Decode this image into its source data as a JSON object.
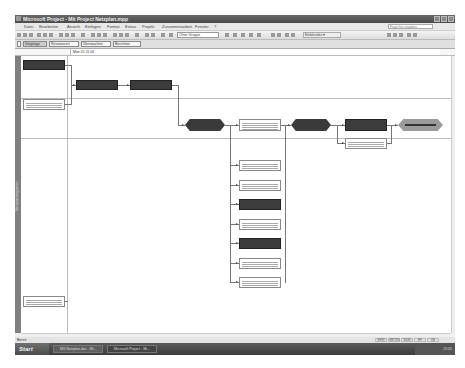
{
  "window": {
    "title": "Microsoft Project - Mit Project Netzplan.mpp"
  },
  "menu": {
    "items": [
      "Datei",
      "Bearbeiten",
      "Ansicht",
      "Einfügen",
      "Format",
      "Extras",
      "Projekt",
      "Zusammenarbeit",
      "Fenster",
      "?"
    ],
    "help_placeholder": "Frage hier eingeben"
  },
  "toolbar": {
    "group_combo": "Ohne Gruppe",
    "zoom_combo": "Einblenden ▾"
  },
  "guide": {
    "buttons": [
      "Vorgänge",
      "Ressourcen",
      "Überwachen",
      "Berichten"
    ]
  },
  "entry": {
    "value": "Mon 01.11.06"
  },
  "view": {
    "label": "Netzplandiagramm"
  },
  "status": {
    "text": "Bereit",
    "indicators": [
      "ERW",
      "GROSS",
      "NUM",
      "RF",
      "ÜB"
    ]
  },
  "taskbar": {
    "start_label": "Start",
    "tasks": [
      "MS Netzplan.doc - Mi...",
      "Microsoft Project - Mi..."
    ],
    "clock": "20:45"
  },
  "diagram": {
    "nodes": [
      {
        "id": "n1",
        "type": "crit",
        "x": 2,
        "y": 4,
        "w": 42,
        "h": 10
      },
      {
        "id": "n2",
        "type": "norm",
        "x": 2,
        "y": 43,
        "w": 42,
        "h": 11
      },
      {
        "id": "n3",
        "type": "crit",
        "x": 55,
        "y": 24,
        "w": 42,
        "h": 10
      },
      {
        "id": "n4",
        "type": "crit",
        "x": 109,
        "y": 24,
        "w": 42,
        "h": 10
      },
      {
        "id": "n5",
        "type": "milestone",
        "x": 164,
        "y": 63,
        "w": 40,
        "h": 12
      },
      {
        "id": "n6",
        "type": "norm",
        "x": 218,
        "y": 63,
        "w": 42,
        "h": 12
      },
      {
        "id": "n7",
        "type": "milestone",
        "x": 270,
        "y": 63,
        "w": 40,
        "h": 12
      },
      {
        "id": "n8",
        "type": "crit",
        "x": 324,
        "y": 63,
        "w": 42,
        "h": 12
      },
      {
        "id": "n9",
        "type": "summary",
        "x": 377,
        "y": 63,
        "w": 45,
        "h": 12
      },
      {
        "id": "n10",
        "type": "norm",
        "x": 324,
        "y": 82,
        "w": 42,
        "h": 11
      },
      {
        "id": "n11",
        "type": "norm",
        "x": 218,
        "y": 104,
        "w": 42,
        "h": 11
      },
      {
        "id": "n12",
        "type": "norm",
        "x": 218,
        "y": 124,
        "w": 42,
        "h": 11
      },
      {
        "id": "n13",
        "type": "crit",
        "x": 218,
        "y": 143,
        "w": 42,
        "h": 11
      },
      {
        "id": "n14",
        "type": "norm",
        "x": 218,
        "y": 163,
        "w": 42,
        "h": 11
      },
      {
        "id": "n15",
        "type": "crit",
        "x": 218,
        "y": 182,
        "w": 42,
        "h": 11
      },
      {
        "id": "n16",
        "type": "norm",
        "x": 218,
        "y": 202,
        "w": 42,
        "h": 11
      },
      {
        "id": "n17",
        "type": "norm",
        "x": 218,
        "y": 221,
        "w": 42,
        "h": 11
      },
      {
        "id": "n18",
        "type": "norm",
        "x": 2,
        "y": 240,
        "w": 42,
        "h": 11
      }
    ]
  },
  "colors": {
    "critical": "#3c3c3c",
    "normal_border": "#888888",
    "summary": "#9a9a9a",
    "titlebar": "#555555"
  }
}
